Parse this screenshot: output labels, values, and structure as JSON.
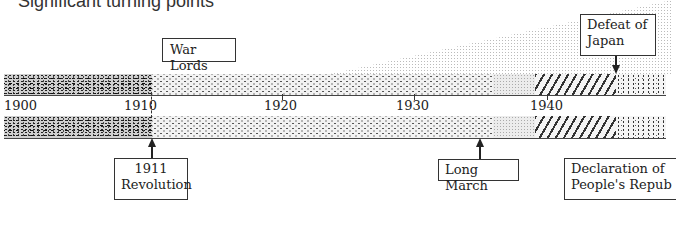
{
  "title": "Significant turning points",
  "axis": {
    "years": [
      {
        "label": "1900",
        "x": 4
      },
      {
        "label": "1910",
        "x": 124
      },
      {
        "label": "1920",
        "x": 264
      },
      {
        "label": "1930",
        "x": 396
      },
      {
        "label": "1940",
        "x": 530
      }
    ]
  },
  "periods": [
    {
      "name": "pre-1911",
      "pattern": "stipple",
      "x0": 0,
      "x1": 148
    },
    {
      "name": "war-lords-era",
      "pattern": "cross",
      "x0": 148,
      "x1": 489
    },
    {
      "name": "transition",
      "pattern": "light",
      "x0": 489,
      "x1": 531
    },
    {
      "name": "war-with-japan",
      "pattern": "hatch",
      "x0": 531,
      "x1": 612
    },
    {
      "name": "civil-war",
      "pattern": "dots",
      "x0": 612,
      "x1": 662
    }
  ],
  "events": {
    "war_lords": {
      "label": "War Lords"
    },
    "defeat_of_japan": {
      "line1": "Defeat of",
      "line2": "Japan"
    },
    "revolution_1911": {
      "line1": "1911",
      "line2": "Revolution"
    },
    "long_march": {
      "label": "Long March"
    },
    "declaration": {
      "line1": "Declaration of",
      "line2": "People's Repub"
    }
  }
}
